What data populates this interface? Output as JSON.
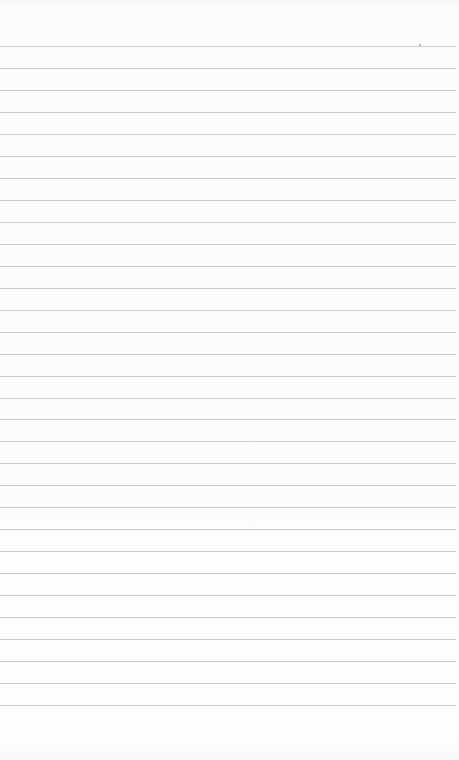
{
  "paper": {
    "type": "ruled-notepaper",
    "background_color": "#fbfbfb",
    "line_color": "#c9c9c9",
    "first_line_y": 46,
    "line_spacing": 21.97,
    "line_count": 31
  }
}
